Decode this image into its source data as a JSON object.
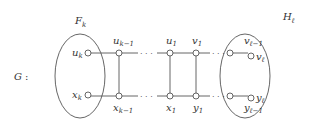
{
  "graph": {
    "name": "G",
    "name_suffix": ":",
    "left_set": {
      "label": "F",
      "sub": "k"
    },
    "right_set": {
      "label": "H",
      "sub": "ℓ"
    },
    "top_nodes": [
      {
        "id": "u_k",
        "label": "u",
        "sub": "k"
      },
      {
        "id": "u_k-1",
        "label": "u",
        "sub": "k−1"
      },
      {
        "id": "u_1",
        "label": "u",
        "sub": "1"
      },
      {
        "id": "v_1",
        "label": "v",
        "sub": "1"
      },
      {
        "id": "v_l-1",
        "label": "v",
        "sub": "ℓ−1"
      },
      {
        "id": "v_l",
        "label": "v",
        "sub": "ℓ"
      }
    ],
    "bottom_nodes": [
      {
        "id": "x_k",
        "label": "x",
        "sub": "k"
      },
      {
        "id": "x_k-1",
        "label": "x",
        "sub": "k−1"
      },
      {
        "id": "x_1",
        "label": "x",
        "sub": "1"
      },
      {
        "id": "y_1",
        "label": "y",
        "sub": "1"
      },
      {
        "id": "y_l-1",
        "label": "y",
        "sub": "ℓ−1"
      },
      {
        "id": "y_l",
        "label": "y",
        "sub": "ℓ"
      }
    ],
    "ellipsis": "· · ·"
  }
}
